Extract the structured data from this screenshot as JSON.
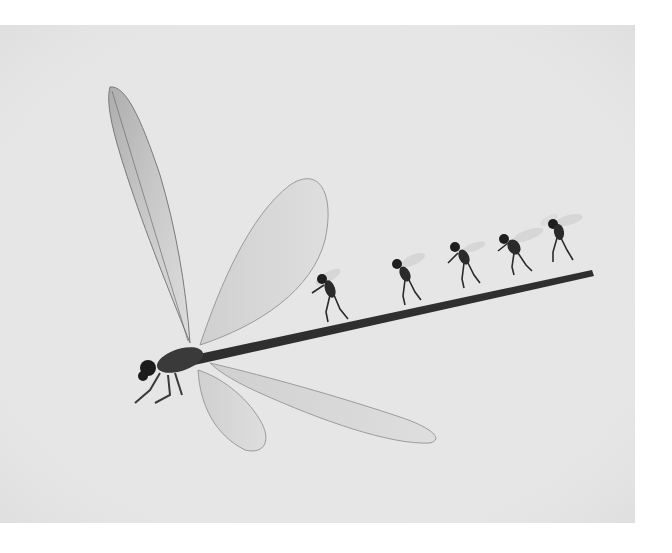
{
  "image": {
    "alt": "Grayscale macro photo of a damselfly whose long abdomen forms a slanted branch on which five small flies walk in a line",
    "background_color": "#e6e6e6",
    "subject": "damselfly",
    "secondary_subjects_count": 5,
    "secondary_subject": "fly",
    "tone": "monochrome"
  }
}
